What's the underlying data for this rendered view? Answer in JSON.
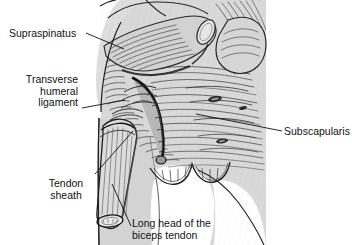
{
  "figure": {
    "type": "anatomical-illustration",
    "style": "pen-and-ink grayscale medical illustration",
    "background_color": "#ffffff",
    "ink_color": "#111111",
    "tissue_fill": "#d8d8d8",
    "bone_fill": "#ffffff",
    "width": 352,
    "height": 245
  },
  "labels": [
    {
      "id": "supraspinatus",
      "text": "Supraspinatus",
      "lines": [
        "Supraspinatus"
      ],
      "align": "left",
      "leader": {
        "from": [
          86,
          33
        ],
        "to": [
          124,
          49
        ]
      }
    },
    {
      "id": "transverse-humeral-ligament",
      "text": "Transverse humeral ligament",
      "lines": [
        "Transverse",
        "humeral",
        "ligament"
      ],
      "align": "right",
      "leader": {
        "from": [
          82,
          108
        ],
        "to": [
          124,
          100
        ]
      }
    },
    {
      "id": "tendon-sheath",
      "text": "Tendon sheath",
      "lines": [
        "Tendon",
        "sheath"
      ],
      "align": "center",
      "leader": {
        "from": [
          94,
          175
        ],
        "to": [
          133,
          131
        ]
      }
    },
    {
      "id": "subscapularis",
      "text": "Subscapularis",
      "lines": [
        "Subscapularis"
      ],
      "align": "left",
      "leader": {
        "from": [
          282,
          131
        ],
        "to": [
          196,
          115
        ]
      }
    },
    {
      "id": "long-head-of-the-biceps-tendon",
      "text": "Long head of the biceps tendon",
      "lines": [
        "Long head of the",
        "biceps tendon"
      ],
      "align": "left",
      "leader": {
        "from": [
          131,
          226
        ],
        "to": [
          113,
          184
        ]
      }
    }
  ],
  "structures": [
    "supraspinatus tendon (cut)",
    "transverse humeral ligament",
    "tendon sheath",
    "long head of the biceps tendon",
    "subscapularis muscle",
    "humeral head",
    "humeral shaft"
  ]
}
